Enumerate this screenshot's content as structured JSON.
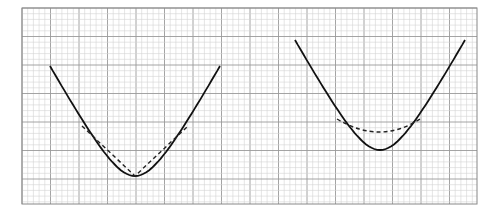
{
  "figure": {
    "background": "#ffffff",
    "grid": {
      "left": 22,
      "top": 8,
      "right": 477,
      "bottom": 204,
      "minor_step": 5.7,
      "major_every": 5,
      "minor_color": "#d4d4d4",
      "major_color": "#9a9a9a",
      "border_color": "#888888"
    },
    "panels": [
      {
        "id": "left",
        "solid_curve": {
          "start": [
            51,
            66
          ],
          "vertex": [
            135,
            176
          ],
          "end": [
            221,
            66
          ],
          "color": "#111111"
        },
        "dashed_overlay": {
          "type": "V-shape (straight segments)",
          "points": [
            [
              82,
              126
            ],
            [
              135,
              176
            ],
            [
              188,
              126
            ]
          ],
          "color": "#222222"
        }
      },
      {
        "id": "right",
        "solid_curve": {
          "start": [
            295,
            40
          ],
          "vertex": [
            380,
            150
          ],
          "end": [
            465,
            40
          ],
          "color": "#111111"
        },
        "dashed_overlay": {
          "type": "shallow arc",
          "start": [
            337,
            119
          ],
          "low": [
            380,
            132
          ],
          "end": [
            420,
            119
          ],
          "color": "#222222"
        }
      }
    ]
  }
}
